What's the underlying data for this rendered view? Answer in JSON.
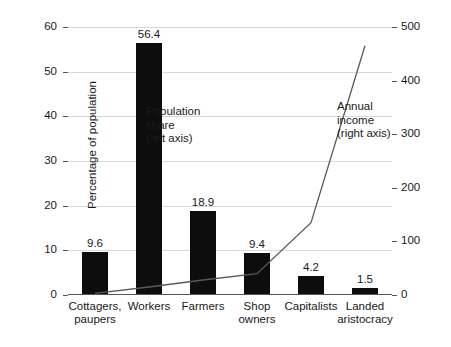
{
  "chart_data": {
    "type": "bar",
    "title": "",
    "subtitle": "",
    "categories": [
      "Cottagers,\npaupers",
      "Workers",
      "Farmers",
      "Shop\nowners",
      "Capitalists",
      "Landed\naristocracy"
    ],
    "series": [
      {
        "name": "Population share (left axis)",
        "type": "bar",
        "axis": "left",
        "values": [
          9.6,
          56.4,
          18.9,
          9.4,
          4.2,
          1.5
        ],
        "data_labels": [
          "9.6",
          "56.4",
          "18.9",
          "9.4",
          "4.2",
          "1.5"
        ],
        "color": "#0d0d0d"
      },
      {
        "name": "Annual income (right axis)",
        "type": "line",
        "axis": "right",
        "values": [
          3,
          15,
          28,
          40,
          135,
          465
        ],
        "color": "#595959"
      }
    ],
    "xlabel": "",
    "ylabel": "Percentage of population",
    "ylabel_right": "Annual income (in pounds)",
    "ylim": [
      0,
      60
    ],
    "yticks": [
      0,
      10,
      20,
      30,
      40,
      50,
      60
    ],
    "ylim_right": [
      0,
      500
    ],
    "yticks_right": [
      0,
      100,
      200,
      300,
      400,
      500
    ],
    "grid": true,
    "legend": "none",
    "annotations": [
      {
        "text": "Population\nshare\n(left axis)",
        "target": "bars"
      },
      {
        "text": "Annual income\n(right axis)",
        "target": "line"
      }
    ]
  },
  "axes": {
    "left_title": "Percentage of population",
    "right_title": "Annual income (in pounds)",
    "left_ticks": [
      "0",
      "10",
      "20",
      "30",
      "40",
      "50",
      "60"
    ],
    "right_ticks": [
      "0",
      "100",
      "200",
      "300",
      "400",
      "500"
    ]
  },
  "annotations": {
    "population": "Population\nshare\n(left axis)",
    "income": "Annual income\n(right axis)"
  },
  "colors": {
    "bar": "#0d0d0d",
    "line": "#595959",
    "grid": "#d9d9d9",
    "axis": "#555555",
    "background": "#ffffff"
  }
}
